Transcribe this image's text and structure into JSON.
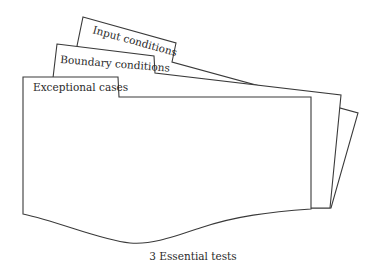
{
  "diagram": {
    "title": "3 Essential tests",
    "cards": [
      {
        "id": "input",
        "label": "Input conditions"
      },
      {
        "id": "boundary",
        "label": "Boundary conditions"
      },
      {
        "id": "exceptional",
        "label": "Exceptional cases"
      }
    ],
    "colors": {
      "stroke": "#3a3a3a",
      "fill": "#ffffff",
      "text": "#2a2a2a"
    }
  }
}
